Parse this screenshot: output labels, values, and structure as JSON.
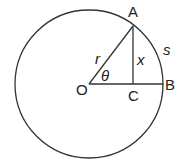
{
  "diagram": {
    "type": "geometry",
    "stroke_color": "#333333",
    "text_color": "#222222",
    "circle": {
      "cx": 89,
      "cy": 84,
      "r": 74
    },
    "points": {
      "O": {
        "label": "O",
        "x": 89,
        "y": 84
      },
      "A": {
        "label": "A",
        "x": 133,
        "y": 26
      },
      "B": {
        "label": "B",
        "x": 163,
        "y": 84
      },
      "C": {
        "label": "C",
        "x": 133,
        "y": 84
      }
    },
    "segments": [
      {
        "from": "O",
        "to": "A",
        "label": "r"
      },
      {
        "from": "A",
        "to": "C",
        "label": "x"
      },
      {
        "from": "O",
        "to": "B",
        "label": ""
      }
    ],
    "labels": {
      "A": "A",
      "B": "B",
      "C": "C",
      "O": "O",
      "r": "r",
      "x": "x",
      "theta": "θ",
      "s": "s"
    }
  }
}
